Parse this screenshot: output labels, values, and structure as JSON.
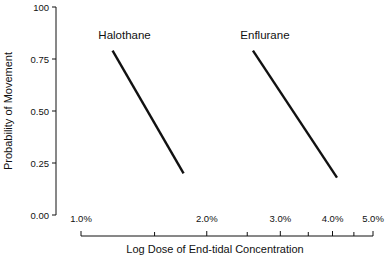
{
  "chart_data": {
    "type": "line",
    "title": "",
    "xlabel": "Log Dose of End-tidal Concentration",
    "ylabel": "Probability of Movement",
    "xscale": "log",
    "xlim": [
      1.0,
      5.0
    ],
    "ylim": [
      0.0,
      1.0
    ],
    "grid": false,
    "legend": "inline labels above lines",
    "x_tick_labels": [
      "1.0%",
      "2.0%",
      "3.0%",
      "4.0%",
      "5.0%"
    ],
    "x_minor_ticks": [
      1.5,
      2.5,
      3.5,
      4.5
    ],
    "y_tick_labels": [
      "0.00",
      "0.25",
      "0.50",
      "0.75",
      "100"
    ],
    "y_ticks": [
      0.0,
      0.25,
      0.5,
      0.75,
      1.0
    ],
    "series": [
      {
        "name": "Halothane",
        "x": [
          1.19,
          1.76
        ],
        "y": [
          0.79,
          0.2
        ]
      },
      {
        "name": "Enflurane",
        "x": [
          2.58,
          4.1
        ],
        "y": [
          0.79,
          0.18
        ]
      }
    ]
  }
}
